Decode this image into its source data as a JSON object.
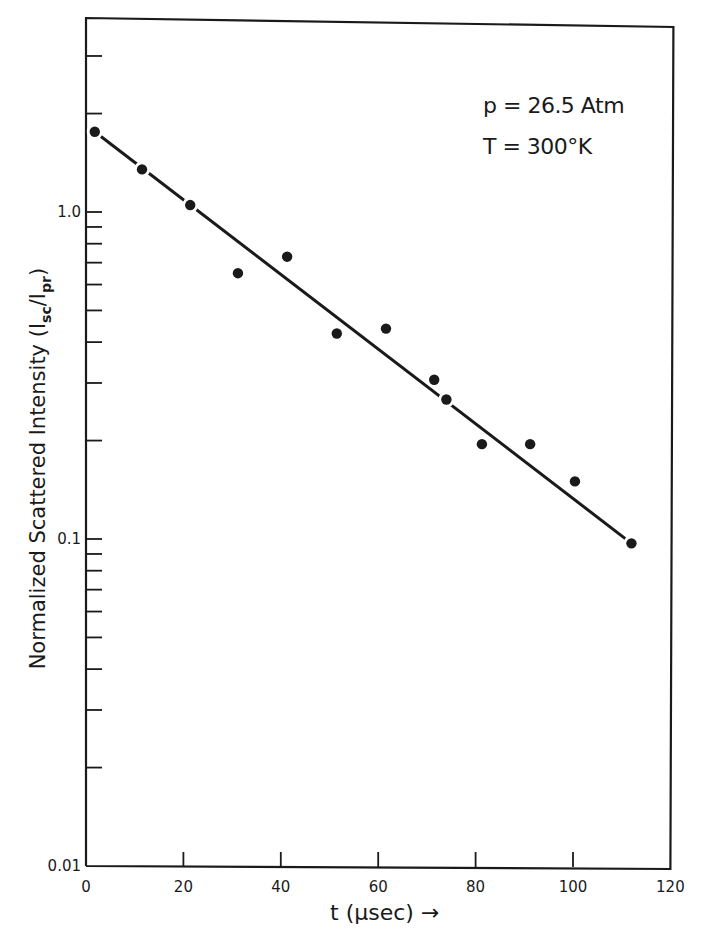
{
  "chart_data": {
    "type": "scatter",
    "title": "",
    "xlabel": "t (μsec) →",
    "ylabel": "Normalized Scattered Intensity (Isc/Ipr)",
    "ylabel_parts": {
      "main": "Normalized Scattered Intensity (I",
      "sub1": "sc",
      "mid": "/I",
      "sub2": "pr",
      "end": ")"
    },
    "xlabel_parts": {
      "var": "t",
      "unit": "(μsec)",
      "arrow": "→"
    },
    "yscale": "log",
    "xlim": [
      0,
      120
    ],
    "ylim": [
      0.01,
      3.2
    ],
    "x_ticks": [
      0,
      20,
      40,
      60,
      80,
      100,
      120
    ],
    "x_tick_labels": [
      "0",
      "20",
      "40",
      "60",
      "80",
      "100",
      "120"
    ],
    "y_tick_labels": [
      {
        "value": 1.0,
        "label": "1.0"
      },
      {
        "value": 0.1,
        "label": "0.1"
      },
      {
        "value": 0.01,
        "label": "0.01"
      }
    ],
    "y_minor_ticks": [
      0.02,
      0.03,
      0.04,
      0.05,
      0.06,
      0.07,
      0.08,
      0.09,
      0.2,
      0.3,
      0.4,
      0.5,
      0.6,
      0.7,
      0.8,
      0.9,
      2,
      3
    ],
    "grid": false,
    "annotations": [
      "p = 26.5 Atm",
      "T = 300°K"
    ],
    "series": [
      {
        "name": "measured",
        "marker": "filled-circle",
        "points": [
          {
            "x": 1.8,
            "y": 1.76
          },
          {
            "x": 11.5,
            "y": 1.35
          },
          {
            "x": 21.4,
            "y": 1.05
          },
          {
            "x": 31.2,
            "y": 0.65
          },
          {
            "x": 41.3,
            "y": 0.73
          },
          {
            "x": 51.5,
            "y": 0.425
          },
          {
            "x": 61.6,
            "y": 0.44
          },
          {
            "x": 71.5,
            "y": 0.307
          },
          {
            "x": 74.0,
            "y": 0.267
          },
          {
            "x": 81.3,
            "y": 0.195
          },
          {
            "x": 91.2,
            "y": 0.195
          },
          {
            "x": 100.4,
            "y": 0.15
          },
          {
            "x": 112.0,
            "y": 0.097
          }
        ]
      },
      {
        "name": "fit",
        "type": "line",
        "points": [
          {
            "x": 1.8,
            "y": 1.76
          },
          {
            "x": 112.0,
            "y": 0.097
          }
        ]
      }
    ]
  },
  "annotations": {
    "pressure": "p = 26.5 Atm",
    "temperature": "T = 300°K"
  },
  "colors": {
    "ink": "#1a1a1a",
    "background": "#ffffff"
  }
}
